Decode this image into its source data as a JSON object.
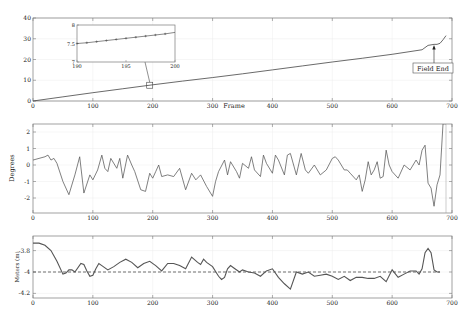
{
  "chart_data": [
    {
      "type": "line",
      "title": "",
      "xlabel": "Frame",
      "ylabel": "",
      "xlim": [
        0,
        700
      ],
      "ylim": [
        0,
        40
      ],
      "xticks": [
        0,
        100,
        200,
        300,
        400,
        500,
        600,
        700
      ],
      "yticks": [
        0,
        10,
        20,
        30,
        40
      ],
      "grid": true,
      "series": [
        {
          "name": "cumulative",
          "x": [
            0,
            50,
            100,
            150,
            200,
            250,
            300,
            350,
            400,
            450,
            500,
            550,
            600,
            650,
            660,
            670,
            675,
            680,
            685,
            690
          ],
          "y": [
            0,
            2.0,
            4.0,
            5.9,
            7.8,
            9.6,
            11.3,
            13.1,
            15.0,
            16.9,
            18.8,
            20.6,
            22.5,
            24.7,
            26.8,
            27.3,
            27.3,
            27.8,
            29.5,
            31.5
          ]
        }
      ],
      "annotations": [
        {
          "text": "Field End",
          "x": 675,
          "y": 27.3,
          "box": true,
          "arrow": true
        }
      ],
      "inset": {
        "xlim": [
          190,
          200
        ],
        "ylim": [
          7,
          8
        ],
        "xticks": [
          190,
          195,
          200
        ],
        "yticks": [
          7,
          7.5,
          8
        ],
        "x": [
          190,
          191,
          192,
          193,
          194,
          195,
          196,
          197,
          198,
          199,
          200
        ],
        "y": [
          7.5,
          7.52,
          7.55,
          7.58,
          7.61,
          7.64,
          7.67,
          7.7,
          7.73,
          7.76,
          7.8
        ],
        "zoom_box_center": [
          195,
          7.6
        ]
      }
    },
    {
      "type": "line",
      "title": "",
      "xlabel": "",
      "ylabel": "Degrees",
      "xlim": [
        0,
        700
      ],
      "ylim": [
        -2.5,
        2.5
      ],
      "xticks": [
        0,
        100,
        200,
        300,
        400,
        500,
        600,
        700
      ],
      "yticks": [
        -2,
        -1,
        0,
        1,
        2
      ],
      "grid": true,
      "series": [
        {
          "name": "angle",
          "x": [
            0,
            10,
            20,
            25,
            30,
            35,
            40,
            50,
            60,
            70,
            78,
            85,
            95,
            100,
            108,
            115,
            120,
            125,
            130,
            140,
            145,
            150,
            158,
            165,
            170,
            180,
            188,
            195,
            200,
            205,
            210,
            215,
            225,
            235,
            245,
            255,
            265,
            272,
            280,
            290,
            300,
            305,
            310,
            320,
            325,
            330,
            340,
            345,
            350,
            360,
            365,
            370,
            380,
            385,
            390,
            400,
            405,
            410,
            420,
            425,
            430,
            440,
            448,
            455,
            460,
            470,
            480,
            490,
            500,
            505,
            510,
            520,
            525,
            530,
            540,
            545,
            550,
            555,
            560,
            565,
            570,
            575,
            580,
            585,
            590,
            595,
            600,
            610,
            620,
            630,
            640,
            645,
            650,
            655,
            660,
            665,
            670,
            675,
            680,
            685,
            690
          ],
          "y": [
            0.3,
            0.4,
            0.5,
            0.6,
            0.3,
            0.4,
            0.1,
            -1.0,
            -1.8,
            -0.6,
            0.5,
            -1.7,
            -0.6,
            -0.9,
            -0.3,
            0.6,
            -0.2,
            -0.4,
            0.4,
            -0.2,
            0.4,
            -0.8,
            0.6,
            0.0,
            -0.4,
            -1.5,
            -1.6,
            -0.5,
            -0.8,
            -0.4,
            0.0,
            -0.7,
            -0.6,
            -0.7,
            -0.2,
            -1.5,
            -0.5,
            -0.9,
            -0.6,
            -1.3,
            -1.9,
            -1.0,
            -0.4,
            0.3,
            -0.6,
            0.2,
            -0.4,
            -0.8,
            0.1,
            -0.2,
            0.5,
            -0.3,
            -0.7,
            0.6,
            0.1,
            -0.5,
            0.6,
            0.3,
            -0.6,
            0.6,
            0.7,
            -0.6,
            0.7,
            -0.3,
            -0.5,
            0.0,
            -0.6,
            -0.3,
            0.4,
            0.5,
            0.3,
            -0.3,
            -0.3,
            -0.5,
            -0.9,
            -0.6,
            -1.6,
            -0.9,
            0.2,
            -0.6,
            -0.3,
            0.2,
            -0.8,
            -0.7,
            0.9,
            0.0,
            -0.4,
            -0.8,
            0.0,
            -0.3,
            0.3,
            0.0,
            0.9,
            1.2,
            -1.1,
            -1.4,
            -2.5,
            -1.2,
            -0.6,
            2.5,
            2.5
          ]
        }
      ]
    },
    {
      "type": "line",
      "title": "",
      "xlabel": "",
      "ylabel": "Meters (m)",
      "xlim": [
        0,
        700
      ],
      "ylim": [
        -4.25,
        -3.65
      ],
      "xticks": [
        0,
        100,
        200,
        300,
        400,
        500,
        600,
        700
      ],
      "yticks": [
        -4.2,
        -4,
        -3.8
      ],
      "grid": true,
      "series": [
        {
          "name": "height",
          "x": [
            0,
            10,
            20,
            30,
            40,
            50,
            55,
            60,
            65,
            70,
            80,
            85,
            90,
            95,
            100,
            105,
            110,
            115,
            125,
            135,
            145,
            155,
            165,
            175,
            185,
            195,
            205,
            215,
            225,
            235,
            245,
            255,
            265,
            275,
            280,
            285,
            290,
            300,
            310,
            315,
            320,
            325,
            330,
            335,
            345,
            350,
            360,
            370,
            380,
            390,
            400,
            410,
            420,
            430,
            440,
            450,
            460,
            470,
            480,
            490,
            500,
            510,
            520,
            530,
            540,
            550,
            560,
            570,
            580,
            590,
            600,
            610,
            620,
            630,
            640,
            645,
            650,
            655,
            660,
            665,
            670,
            675,
            680
          ],
          "y": [
            -3.73,
            -3.73,
            -3.75,
            -3.8,
            -3.9,
            -4.02,
            -4.01,
            -3.98,
            -3.98,
            -4.0,
            -3.92,
            -3.93,
            -3.99,
            -4.04,
            -4.03,
            -3.97,
            -3.92,
            -3.94,
            -3.98,
            -3.95,
            -3.91,
            -3.88,
            -3.91,
            -3.96,
            -3.92,
            -3.9,
            -3.94,
            -3.99,
            -3.92,
            -3.92,
            -3.94,
            -3.97,
            -3.86,
            -3.91,
            -3.93,
            -3.88,
            -3.91,
            -3.95,
            -4.04,
            -4.07,
            -4.05,
            -3.97,
            -3.94,
            -3.96,
            -4.0,
            -3.98,
            -4.0,
            -4.01,
            -4.04,
            -3.99,
            -3.97,
            -4.05,
            -4.11,
            -4.16,
            -4.0,
            -4.02,
            -4.0,
            -4.04,
            -4.03,
            -4.02,
            -4.04,
            -4.07,
            -4.04,
            -4.08,
            -4.05,
            -4.05,
            -4.06,
            -4.06,
            -4.04,
            -4.09,
            -3.98,
            -4.05,
            -4.02,
            -3.99,
            -3.99,
            -4.02,
            -3.97,
            -3.82,
            -3.78,
            -3.82,
            -3.98,
            -4.0,
            -4.0
          ]
        },
        {
          "name": "reference",
          "style": "dashed",
          "x": [
            0,
            680
          ],
          "y": [
            -4.0,
            -4.0
          ]
        }
      ]
    }
  ],
  "figure": {
    "panel1": {
      "xlabel": "Frame",
      "ytick_labels": [
        "0",
        "10",
        "20",
        "30",
        "40"
      ],
      "xtick_labels": [
        "0",
        "100",
        "200",
        "300",
        "400",
        "500",
        "600",
        "700"
      ],
      "annotation": "Field End",
      "inset_xtick_labels": [
        "190",
        "195",
        "200"
      ],
      "inset_ytick_labels": [
        "7",
        "7.5",
        "8"
      ]
    },
    "panel2": {
      "ylabel": "Degrees",
      "ytick_labels": [
        "2",
        "1",
        "0",
        "-1",
        "-2"
      ],
      "xtick_labels": [
        "0",
        "100",
        "200",
        "300",
        "400",
        "500",
        "600",
        "700"
      ]
    },
    "panel3": {
      "ylabel": "Meters (m)",
      "ytick_labels": [
        "-3.8",
        "-4",
        "-4.2"
      ],
      "xtick_labels": [
        "0",
        "100",
        "200",
        "300",
        "400",
        "500",
        "600",
        "700"
      ]
    },
    "colors": {
      "axis": "#7a7a7a",
      "line": "#444444",
      "grid": "#e6e6e6",
      "text": "#222222"
    }
  }
}
